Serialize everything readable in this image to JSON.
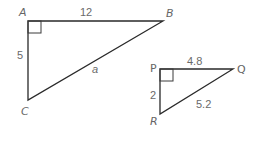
{
  "diagram": {
    "triangles": [
      {
        "id": "ABC",
        "right_angle_at": "A",
        "vertices": {
          "A": {
            "label": "A"
          },
          "B": {
            "label": "B"
          },
          "C": {
            "label": "C"
          }
        },
        "sides": {
          "AB": {
            "label": "12"
          },
          "AC": {
            "label": "5"
          },
          "BC": {
            "label": "a"
          }
        }
      },
      {
        "id": "PQR",
        "right_angle_at": "P",
        "vertices": {
          "P": {
            "label": "P"
          },
          "Q": {
            "label": "Q"
          },
          "R": {
            "label": "R"
          }
        },
        "sides": {
          "PQ": {
            "label": "4.8"
          },
          "PR": {
            "label": "2"
          },
          "QR": {
            "label": "5.2"
          }
        }
      }
    ]
  }
}
